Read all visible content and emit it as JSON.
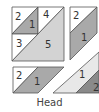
{
  "diagram": {
    "title": "Head",
    "colors": {
      "white": "#ffffff",
      "medium_gray": "#a9a9a9",
      "light_gray": "#d3d3d3",
      "pale_gray": "#e8e8e8",
      "dark_gray": "#8a8a8a",
      "outline": "#555555"
    },
    "block_main": {
      "pieces": [
        {
          "label": "2",
          "fill": "white"
        },
        {
          "label": "1",
          "fill": "medium_gray"
        },
        {
          "label": "4",
          "fill": "white"
        },
        {
          "label": "3",
          "fill": "white"
        },
        {
          "label": "5",
          "fill": "light_gray"
        }
      ]
    },
    "block_right": {
      "pieces": [
        {
          "label": "2",
          "fill": "white"
        },
        {
          "label": "1",
          "fill": "medium_gray"
        }
      ]
    },
    "block_bottom_left": {
      "pieces": [
        {
          "label": "2",
          "fill": "white"
        },
        {
          "label": "1",
          "fill": "medium_gray"
        }
      ]
    },
    "block_bottom_right": {
      "pieces": [
        {
          "label": "1",
          "fill": "pale_gray"
        },
        {
          "label": "2",
          "fill": "dark_gray"
        }
      ]
    }
  }
}
